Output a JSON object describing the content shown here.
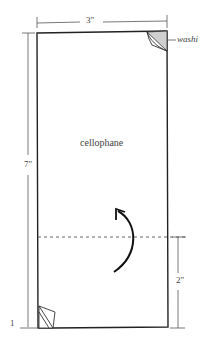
{
  "diagram": {
    "width_label": "3\"",
    "height_label": "7\"",
    "fold_label": "2\"",
    "material_label": "cellophane",
    "tape_label": "washi",
    "step_number": "1",
    "colors": {
      "stroke": "#222222",
      "tape_fill": "#cfcfcf",
      "text": "#444444"
    }
  }
}
